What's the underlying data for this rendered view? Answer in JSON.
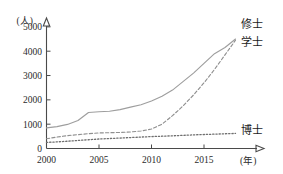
{
  "chart_data": {
    "type": "line",
    "title": "",
    "xlabel": "(年)",
    "ylabel": "(人)",
    "xlim": [
      2000,
      2019
    ],
    "ylim": [
      0,
      5200
    ],
    "grid": false,
    "legend_position": "line-end-right",
    "x_ticks": [
      "2000",
      "2005",
      "2010",
      "2015"
    ],
    "x_tick_values": [
      2000,
      2005,
      2010,
      2015
    ],
    "y_ticks": [
      "0",
      "1000",
      "2000",
      "3000",
      "4000",
      "5000"
    ],
    "y_tick_values": [
      0,
      1000,
      2000,
      3000,
      4000,
      5000
    ],
    "x": [
      2000,
      2001,
      2002,
      2003,
      2004,
      2005,
      2006,
      2007,
      2008,
      2009,
      2010,
      2011,
      2012,
      2013,
      2014,
      2015,
      2016,
      2017,
      2018
    ],
    "series": [
      {
        "name": "修士",
        "style": "solid",
        "color": "#9e9e9e",
        "label": "修士",
        "values": [
          850,
          900,
          990,
          1150,
          1480,
          1510,
          1530,
          1600,
          1700,
          1800,
          1950,
          2150,
          2400,
          2750,
          3100,
          3500,
          3900,
          4150,
          4500
        ]
      },
      {
        "name": "学士",
        "style": "dashed",
        "color": "#8f8f8f",
        "label": "学士",
        "values": [
          400,
          470,
          530,
          570,
          610,
          640,
          650,
          660,
          680,
          720,
          800,
          1000,
          1350,
          1750,
          2200,
          2700,
          3250,
          3850,
          4450
        ]
      },
      {
        "name": "博士",
        "style": "dotted",
        "color": "#6f6f6f",
        "label": "博士",
        "values": [
          250,
          270,
          300,
          330,
          360,
          390,
          410,
          430,
          450,
          470,
          490,
          505,
          520,
          540,
          560,
          575,
          590,
          605,
          620
        ]
      }
    ]
  }
}
